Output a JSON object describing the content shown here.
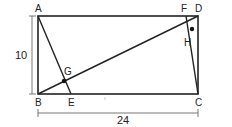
{
  "diagram": {
    "type": "geometry",
    "shape": "rectangle ABCD",
    "points": {
      "A": {
        "label": "A",
        "x": 38,
        "y": 16
      },
      "B": {
        "label": "B",
        "x": 38,
        "y": 94
      },
      "C": {
        "label": "C",
        "x": 198,
        "y": 94
      },
      "D": {
        "label": "D",
        "x": 198,
        "y": 16
      },
      "E": {
        "label": "E",
        "x": 71,
        "y": 94
      },
      "F": {
        "label": "F",
        "x": 186,
        "y": 16
      },
      "G": {
        "label": "G",
        "x": 64,
        "y": 81
      },
      "H": {
        "label": "H",
        "x": 192,
        "y": 29
      }
    },
    "segments": [
      "AB",
      "BC",
      "CD",
      "DA",
      "BD",
      "AE",
      "CF"
    ],
    "dimensions": {
      "height": {
        "label": "10"
      },
      "width": {
        "label": "24"
      }
    },
    "colors": {
      "stroke": "#222222",
      "dimension": "#555555",
      "background": "#ffffff"
    }
  }
}
